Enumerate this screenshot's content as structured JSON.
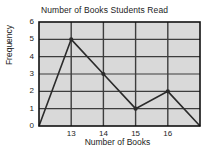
{
  "chart_data": {
    "type": "line",
    "title": "Number of Books Students Read",
    "xlabel": "Number of Books",
    "ylabel": "Frequency",
    "x": [
      12,
      13,
      14,
      15,
      16,
      17
    ],
    "values": [
      0,
      5,
      3,
      1,
      2,
      0
    ],
    "categories": [
      "12",
      "13",
      "14",
      "15",
      "16",
      "17"
    ],
    "xtick_labels": [
      "13",
      "14",
      "15",
      "16"
    ],
    "xtick_values": [
      13,
      14,
      15,
      16
    ],
    "ytick_labels": [
      "0",
      "1",
      "2",
      "3",
      "4",
      "5",
      "6"
    ],
    "ytick_values": [
      0,
      1,
      2,
      3,
      4,
      5,
      6
    ],
    "xlim": [
      12,
      17
    ],
    "ylim": [
      0,
      6
    ],
    "grid": true,
    "legend": "none",
    "markers": [
      {
        "x": 13,
        "y": 5
      },
      {
        "x": 14,
        "y": 3
      },
      {
        "x": 15,
        "y": 1
      },
      {
        "x": 16,
        "y": 2
      }
    ],
    "plot_background": "#d9d9d9",
    "line_color": "#2b2b2b",
    "grid_color": "#3d3d3d",
    "frame_color": "#111111",
    "page_background": "#ffffff"
  }
}
